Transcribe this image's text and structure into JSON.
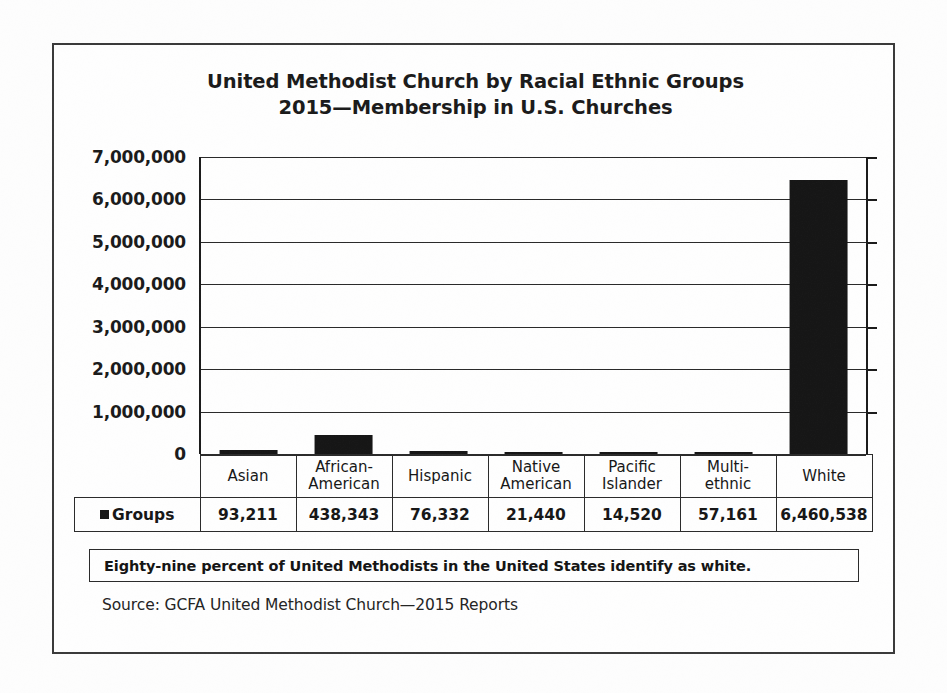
{
  "figure": {
    "title_lines": [
      "United Methodist Church by Racial Ethnic Groups",
      "2015—Membership in U.S. Churches"
    ],
    "annotation": "Eighty-nine percent of United Methodists in the United States identify as white.",
    "source": "Source: GCFA United Methodist Church—2015 Reports",
    "legend_label": "Groups",
    "colors": {
      "bar": "#161616",
      "axis": "#1b1b1b",
      "grid": "#2a2a2a",
      "border": "#3a3a3a",
      "text": "#171717",
      "background": "#fefefe"
    }
  },
  "chart_data": {
    "type": "bar",
    "title": "United Methodist Church by Racial Ethnic Groups 2015—Membership in U.S. Churches",
    "subtitle": "2015—Membership in U.S. Churches",
    "xlabel": "",
    "ylabel": "",
    "categories": [
      "Asian",
      "African-American",
      "Hispanic",
      "Native American",
      "Pacific Islander",
      "Multi-ethnic",
      "White"
    ],
    "category_label_lines": [
      [
        "Asian"
      ],
      [
        "African-",
        "American"
      ],
      [
        "Hispanic"
      ],
      [
        "Native",
        "American"
      ],
      [
        "Pacific",
        "Islander"
      ],
      [
        "Multi-",
        "ethnic"
      ],
      [
        "White"
      ]
    ],
    "series": [
      {
        "name": "Groups",
        "values": [
          93211,
          438343,
          76332,
          21440,
          14520,
          57161,
          6460538
        ],
        "value_labels": [
          "93,211",
          "438,343",
          "76,332",
          "21,440",
          "14,520",
          "57,161",
          "6,460,538"
        ]
      }
    ],
    "ylim": [
      0,
      7000000
    ],
    "ytick_values": [
      7000000,
      6000000,
      5000000,
      4000000,
      3000000,
      2000000,
      1000000,
      0
    ],
    "ytick_labels": [
      "7,000,000",
      "6,000,000",
      "5,000,000",
      "4,000,000",
      "3,000,000",
      "2,000,000",
      "1,000,000",
      "0"
    ],
    "grid": true,
    "legend_position": "table-row",
    "annotations": [
      "Eighty-nine percent of United Methodists in the United States identify as white."
    ]
  }
}
